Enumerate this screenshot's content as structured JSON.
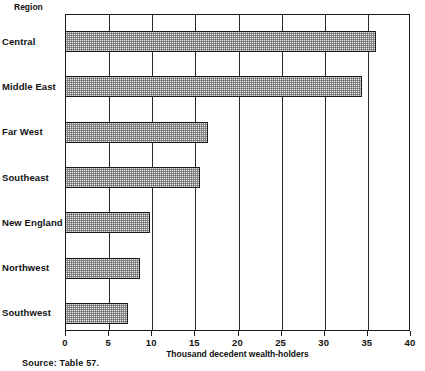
{
  "chart_data": {
    "type": "bar",
    "orientation": "horizontal",
    "title": "",
    "subtitle": "",
    "categories": [
      "Central",
      "Middle East",
      "Far West",
      "Southeast",
      "New England",
      "Northwest",
      "Southwest"
    ],
    "values": [
      36.1,
      34.4,
      16.6,
      15.7,
      9.8,
      8.7,
      7.3
    ],
    "series": [
      {
        "name": "Thousand decedent wealth-holders",
        "values": [
          36.1,
          34.4,
          16.6,
          15.7,
          9.8,
          8.7,
          7.3
        ]
      }
    ],
    "xlabel": "Thousand decedent wealth-holders",
    "ylabel": "Region",
    "xlim": [
      0,
      40
    ],
    "xticks": [
      0,
      5,
      10,
      15,
      20,
      25,
      30,
      35,
      40
    ],
    "xtick_labels": [
      "0",
      "5",
      "10",
      "15",
      "20",
      "25",
      "30",
      "35",
      "40"
    ],
    "grid": "vertical",
    "legend": "none",
    "bar_fill": "stipple-pattern-gray",
    "bar_fill_color": "#e3e3e3",
    "bar_edge_color": "#1a1a1a",
    "axis_color": "#1a1a1a",
    "background_color": "#ffffff"
  },
  "labels": {
    "region_header": "Region",
    "x_axis_title": "Thousand decedent wealth-holders",
    "source_note": "Source: Table 57."
  }
}
